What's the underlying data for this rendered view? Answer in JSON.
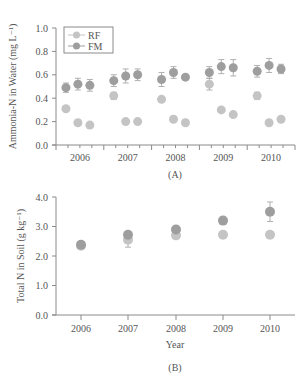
{
  "chart_data": [
    {
      "id": "A",
      "type": "scatter",
      "caption": "(A)",
      "title": "",
      "xlabel": "",
      "ylabel": "Ammonia-N in Water (mg L⁻¹)",
      "ylim": [
        0,
        1.0
      ],
      "yticks": [
        "0.0",
        "0.2",
        "0.4",
        "0.6",
        "0.8",
        "1.0"
      ],
      "categories": [
        "2006",
        "2007",
        "2008",
        "2009",
        "2010"
      ],
      "legend": [
        "RF",
        "FM"
      ],
      "legend_position": "top-left",
      "points_per_year": 3,
      "series": [
        {
          "name": "RF",
          "color": "#c4c4c4",
          "values": [
            0.31,
            0.19,
            0.17,
            0.42,
            0.2,
            0.2,
            0.39,
            0.22,
            0.19,
            0.52,
            0.3,
            0.26,
            0.42,
            0.19,
            0.22
          ],
          "errors": [
            0.0,
            0.0,
            0.0,
            0.03,
            0.0,
            0.0,
            0.0,
            0.0,
            0.0,
            0.05,
            0.0,
            0.0,
            0.03,
            0.0,
            0.0
          ]
        },
        {
          "name": "FM",
          "color": "#9e9e9e",
          "values": [
            0.49,
            0.52,
            0.51,
            0.55,
            0.59,
            0.6,
            0.56,
            0.62,
            0.58,
            0.62,
            0.67,
            0.66,
            0.63,
            0.68,
            0.65
          ],
          "errors": [
            0.04,
            0.05,
            0.05,
            0.05,
            0.06,
            0.05,
            0.06,
            0.05,
            0.0,
            0.05,
            0.06,
            0.07,
            0.05,
            0.06,
            0.04
          ]
        }
      ]
    },
    {
      "id": "B",
      "type": "scatter",
      "caption": "(B)",
      "title": "",
      "xlabel": "Year",
      "ylabel": "Total N in Soil (g kg⁻¹)",
      "ylim": [
        0,
        4.0
      ],
      "yticks": [
        "0.0",
        "1.0",
        "2.0",
        "3.0",
        "4.0"
      ],
      "categories": [
        "2006",
        "2007",
        "2008",
        "2009",
        "2010"
      ],
      "series": [
        {
          "name": "RF",
          "color": "#c4c4c4",
          "values": [
            2.35,
            2.55,
            2.7,
            2.72,
            2.72
          ],
          "errors": [
            0.05,
            0.25,
            0.1,
            0.05,
            0.05
          ]
        },
        {
          "name": "FM",
          "color": "#9e9e9e",
          "values": [
            2.38,
            2.72,
            2.9,
            3.2,
            3.5
          ],
          "errors": [
            0.05,
            0.1,
            0.1,
            0.12,
            0.33
          ]
        }
      ]
    }
  ]
}
